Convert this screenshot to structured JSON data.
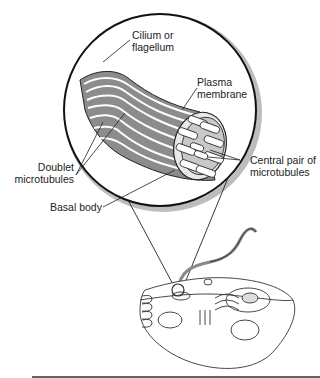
{
  "figure": {
    "labels": {
      "cilium": [
        "Cilium or",
        "flagellum"
      ],
      "membrane": [
        "Plasma",
        "membrane"
      ],
      "doublet": [
        "Doublet",
        "microtubules"
      ],
      "central": [
        "Central pair of",
        "microtubules"
      ],
      "basal": [
        "Basal body"
      ]
    }
  },
  "colors": {
    "line": "#222222",
    "shade": "#9a9a9a",
    "background": "#ffffff"
  }
}
